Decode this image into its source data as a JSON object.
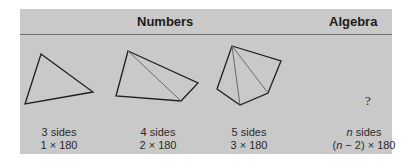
{
  "header": {
    "numbers_label": "Numbers",
    "algebra_label": "Algebra"
  },
  "figures": [
    {
      "shape": "triangle",
      "sides_label": "3 sides",
      "formula": "1 × 180"
    },
    {
      "shape": "quadrilateral",
      "sides_label": "4 sides",
      "formula": "2 × 180"
    },
    {
      "shape": "pentagon",
      "sides_label": "5 sides",
      "formula": "3 × 180"
    },
    {
      "shape": "unknown",
      "placeholder": "?",
      "sides_var": "n",
      "sides_suffix": " sides",
      "formula_open": "(",
      "formula_var": "n",
      "formula_rest": " − 2) × 180"
    }
  ],
  "colors": {
    "panel_background": "#c9c9c9",
    "stroke": "#1e1e1e",
    "diagonal": "#6a6a6a"
  }
}
